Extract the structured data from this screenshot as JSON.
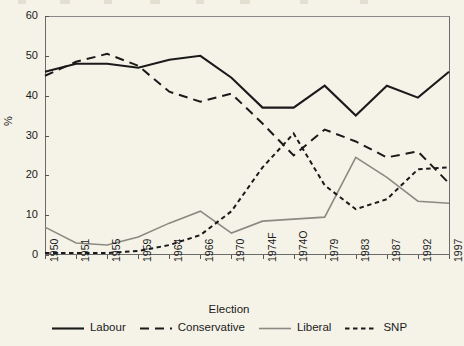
{
  "chart_data": {
    "type": "line",
    "title": "",
    "xlabel": "Election",
    "ylabel": "%",
    "ylim": [
      0,
      60
    ],
    "yticks": [
      0,
      10,
      20,
      30,
      40,
      50,
      60
    ],
    "grid": false,
    "legend_position": "bottom",
    "categories": [
      "1950",
      "1951",
      "1955",
      "1959",
      "1964",
      "1966",
      "1970",
      "1974F",
      "1974O",
      "1979",
      "1983",
      "1987",
      "1992",
      "1997"
    ],
    "series": [
      {
        "name": "Labour",
        "style": "solid-thick",
        "color": "#1a1a1a",
        "values": [
          46.0,
          48.0,
          48.0,
          47.0,
          49.0,
          50.0,
          44.5,
          37.0,
          37.0,
          42.5,
          35.0,
          42.5,
          39.5,
          46.0
        ]
      },
      {
        "name": "Conservative",
        "style": "dashed",
        "color": "#1a1a1a",
        "values": [
          45.0,
          48.5,
          50.5,
          47.5,
          41.0,
          38.5,
          40.5,
          33.0,
          25.0,
          31.5,
          28.5,
          24.5,
          26.0,
          18.0
        ]
      },
      {
        "name": "Liberal",
        "style": "solid-thin",
        "color": "#8a8a82",
        "values": [
          7.0,
          3.0,
          2.5,
          4.5,
          8.0,
          11.0,
          5.5,
          8.5,
          9.0,
          9.5,
          24.5,
          19.5,
          13.5,
          13.0
        ]
      },
      {
        "name": "SNP",
        "style": "dotted",
        "color": "#1a1a1a",
        "values": [
          0.5,
          0.5,
          0.5,
          1.0,
          2.5,
          5.0,
          11.0,
          22.0,
          30.5,
          17.5,
          11.5,
          14.0,
          21.5,
          22.0
        ]
      }
    ]
  },
  "axis": {
    "y_title": "%",
    "x_title": "Election"
  },
  "legend": {
    "items": [
      {
        "label": "Labour"
      },
      {
        "label": "Conservative"
      },
      {
        "label": "Liberal"
      },
      {
        "label": "SNP"
      }
    ]
  }
}
